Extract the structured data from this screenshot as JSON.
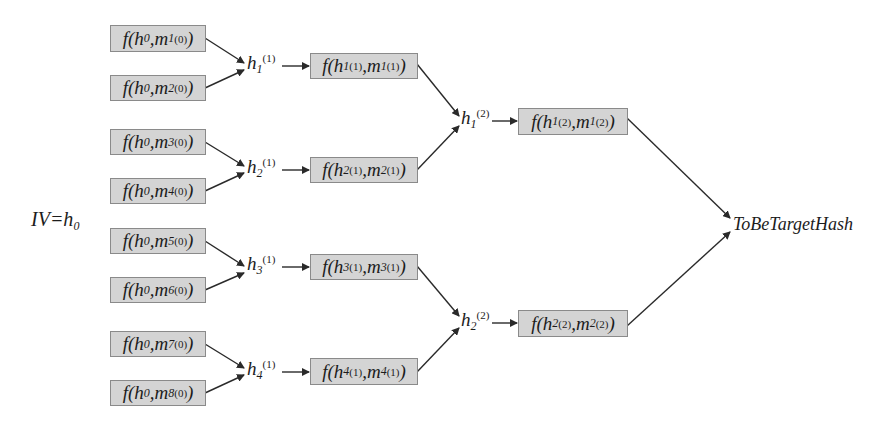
{
  "diagram": {
    "iv_label": {
      "main": "IV=h",
      "sub": "0"
    },
    "target_label": "ToBeTargetHash",
    "level0": [
      {
        "f": "f(",
        "h": "h",
        "hs": "0",
        "m": ",m",
        "ms": "1",
        "mp": "(0)",
        "close": ")"
      },
      {
        "f": "f(",
        "h": "h",
        "hs": "0",
        "m": ",m",
        "ms": "2",
        "mp": "(0)",
        "close": ")"
      },
      {
        "f": "f(",
        "h": "h",
        "hs": "0",
        "m": ",m",
        "ms": "3",
        "mp": "(0)",
        "close": ")"
      },
      {
        "f": "f(",
        "h": "h",
        "hs": "0",
        "m": ",m",
        "ms": "4",
        "mp": "(0)",
        "close": ")"
      },
      {
        "f": "f(",
        "h": "h",
        "hs": "0",
        "m": ",m",
        "ms": "5",
        "mp": "(0)",
        "close": ")"
      },
      {
        "f": "f(",
        "h": "h",
        "hs": "0",
        "m": ",m",
        "ms": "6",
        "mp": "(0)",
        "close": ")"
      },
      {
        "f": "f(",
        "h": "h",
        "hs": "0",
        "m": ",m",
        "ms": "7",
        "mp": "(0)",
        "close": ")"
      },
      {
        "f": "f(",
        "h": "h",
        "hs": "0",
        "m": ",m",
        "ms": "8",
        "mp": "(0)",
        "close": ")"
      }
    ],
    "h1_labels": [
      {
        "h": "h",
        "sub": "1",
        "sup": "(1)"
      },
      {
        "h": "h",
        "sub": "2",
        "sup": "(1)"
      },
      {
        "h": "h",
        "sub": "3",
        "sup": "(1)"
      },
      {
        "h": "h",
        "sub": "4",
        "sup": "(1)"
      }
    ],
    "level1": [
      {
        "f": "f(",
        "h": "h",
        "hs": "1",
        "hp": "(1)",
        "m": ",m",
        "ms": "1",
        "mp": "(1)",
        "close": ")"
      },
      {
        "f": "f(",
        "h": "h",
        "hs": "2",
        "hp": "(1)",
        "m": ",m",
        "ms": "2",
        "mp": "(1)",
        "close": ")"
      },
      {
        "f": "f(",
        "h": "h",
        "hs": "3",
        "hp": "(1)",
        "m": ",m",
        "ms": "3",
        "mp": "(1)",
        "close": ")"
      },
      {
        "f": "f(",
        "h": "h",
        "hs": "4",
        "hp": "(1)",
        "m": ",m",
        "ms": "4",
        "mp": "(1)",
        "close": ")"
      }
    ],
    "h2_labels": [
      {
        "h": "h",
        "sub": "1",
        "sup": "(2)"
      },
      {
        "h": "h",
        "sub": "2",
        "sup": "(2)"
      }
    ],
    "level2": [
      {
        "f": "f(",
        "h": "h",
        "hs": "1",
        "hp": "(2)",
        "m": ",m",
        "ms": "1",
        "mp": "(2)",
        "close": ")"
      },
      {
        "f": "f(",
        "h": "h",
        "hs": "2",
        "hp": "(2)",
        "m": ",m",
        "ms": "2",
        "mp": "(2)",
        "close": ")"
      }
    ],
    "colors": {
      "box_fill": "#d4d4d4",
      "box_border": "#8a8a8a",
      "line": "#2a2a2a",
      "text": "#1c1c1c"
    }
  }
}
